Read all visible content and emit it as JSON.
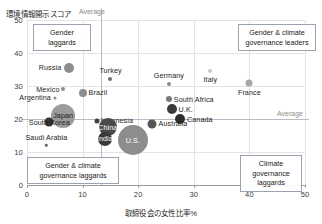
{
  "chart_data": {
    "type": "scatter",
    "title": "",
    "xlabel": "取締役会の女性比率%",
    "ylabel": "環境情報開示スコア",
    "xlim": [
      0,
      50
    ],
    "ylim": [
      0,
      50
    ],
    "xticks": [
      "0",
      "10",
      "20",
      "30",
      "40",
      "50"
    ],
    "yticks": [
      "50",
      "40",
      "30",
      "20",
      "10",
      "0"
    ],
    "grid": true,
    "legend": "none",
    "reference_lines": [
      {
        "axis": "x",
        "value": 13.3,
        "label": "Average"
      },
      {
        "axis": "y",
        "value": 20.0,
        "label": "Average"
      }
    ],
    "annotations": [
      {
        "id": "gender-laggards",
        "text": "Gender laggards",
        "quadrant": "top-left"
      },
      {
        "id": "gender-climate-leaders",
        "text": "Gender & climate governance leaders",
        "quadrant": "top-right"
      },
      {
        "id": "gender-climate-laggards",
        "text": "Gender & climate governance laggards",
        "quadrant": "bottom-left"
      },
      {
        "id": "climate-laggards",
        "text": "Climate governance laggards",
        "quadrant": "bottom-right"
      }
    ],
    "bubble_encoding": "bubble area represents relative market / emissions size",
    "points": [
      {
        "name": "Russia",
        "x": 7.5,
        "y": 35.5,
        "r": 5,
        "color": "#8d8d8d",
        "label_pos": "left",
        "label_color": "dark"
      },
      {
        "name": "Turkey",
        "x": 15.0,
        "y": 32.0,
        "r": 2,
        "color": "#6f6f6f",
        "label_pos": "top",
        "label_color": "dark"
      },
      {
        "name": "Mexico",
        "x": 6.5,
        "y": 29.0,
        "r": 2,
        "color": "#8d8d8d",
        "label_pos": "left",
        "label_color": "dark"
      },
      {
        "name": "Brazil",
        "x": 10.0,
        "y": 28.0,
        "r": 4,
        "color": "#8d8d8d",
        "label_pos": "right",
        "label_color": "dark"
      },
      {
        "name": "Argentina",
        "x": 5.0,
        "y": 26.5,
        "r": 1.5,
        "color": "#8d8d8d",
        "label_pos": "left",
        "label_color": "dark"
      },
      {
        "name": "Germany",
        "x": 25.5,
        "y": 30.5,
        "r": 2,
        "color": "#8d8d8d",
        "label_pos": "top",
        "label_color": "dark"
      },
      {
        "name": "Italy",
        "x": 33.0,
        "y": 34.5,
        "r": 2,
        "color": "#c9c9c9",
        "label_pos": "bottom",
        "label_color": "dark"
      },
      {
        "name": "France",
        "x": 40.0,
        "y": 31.0,
        "r": 3.5,
        "color": "#a8a8a8",
        "label_pos": "bottom",
        "label_color": "dark"
      },
      {
        "name": "South Africa",
        "x": 25.5,
        "y": 26.0,
        "r": 3,
        "color": "#7a7a7a",
        "label_pos": "right",
        "label_color": "dark"
      },
      {
        "name": "U.K.",
        "x": 26.0,
        "y": 23.0,
        "r": 5,
        "color": "#3b3b3b",
        "label_pos": "right",
        "label_color": "dark"
      },
      {
        "name": "Canada",
        "x": 27.5,
        "y": 20.0,
        "r": 5,
        "color": "#2e2e2e",
        "label_pos": "right",
        "label_color": "dark"
      },
      {
        "name": "Australia",
        "x": 22.5,
        "y": 18.5,
        "r": 4.5,
        "color": "#565656",
        "label_pos": "right",
        "label_color": "dark"
      },
      {
        "name": "Japan",
        "x": 6.5,
        "y": 21.0,
        "r": 12,
        "color": "#9b9b9b",
        "label_pos": "center",
        "label_color": "dark"
      },
      {
        "name": "South Korea",
        "x": 4.0,
        "y": 19.0,
        "r": 4.5,
        "color": "#343434",
        "label_pos": "center",
        "label_color": "dark"
      },
      {
        "name": "Indonesia",
        "x": 12.5,
        "y": 19.5,
        "r": 2.5,
        "color": "#3f3f3f",
        "label_pos": "right",
        "label_color": "dark"
      },
      {
        "name": "China",
        "x": 14.5,
        "y": 17.5,
        "r": 9,
        "color": "#4a4a4a",
        "label_pos": "center",
        "label_color": "light"
      },
      {
        "name": "India",
        "x": 14.0,
        "y": 14.0,
        "r": 7,
        "color": "#3a3a3a",
        "label_pos": "center",
        "label_color": "light"
      },
      {
        "name": "U.S.",
        "x": 19.0,
        "y": 13.5,
        "r": 15,
        "color": "#8d8d8d",
        "label_pos": "center",
        "label_color": "light"
      },
      {
        "name": "Saudi Arabia",
        "x": 3.5,
        "y": 12.0,
        "r": 1.2,
        "color": "#6b6b6b",
        "label_pos": "top",
        "label_color": "dark"
      }
    ]
  }
}
